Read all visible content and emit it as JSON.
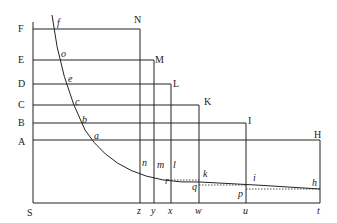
{
  "diagram": {
    "left_labels": [
      "F",
      "E",
      "D",
      "C",
      "B",
      "A",
      "S"
    ],
    "corner_labels": [
      "N",
      "M",
      "L",
      "K",
      "I",
      "H"
    ],
    "curve_labels": [
      "f",
      "o",
      "e",
      "c",
      "b",
      "a",
      "n",
      "m",
      "l",
      "k",
      "i",
      "h"
    ],
    "inner_labels": [
      "r",
      "q",
      "p"
    ],
    "bottom_labels": [
      "z",
      "y",
      "x",
      "w",
      "u",
      "t"
    ],
    "colors": {
      "line": "#222222",
      "background": "#ffffff"
    }
  }
}
